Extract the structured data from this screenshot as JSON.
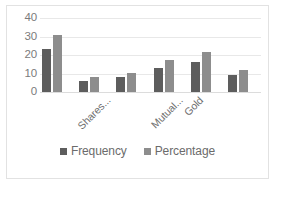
{
  "chart_data": {
    "type": "bar",
    "title": "",
    "xlabel": "",
    "ylabel": "",
    "ylim": [
      0,
      40
    ],
    "yticks": [
      "40",
      "30",
      "20",
      "10",
      "0"
    ],
    "grid": true,
    "legend_position": "bottom",
    "categories": [
      "Shares...",
      "",
      "Mutual...",
      "Gold",
      "",
      ""
    ],
    "visible_tick_labels": [
      "Shares...",
      "Mutual...",
      "Gold"
    ],
    "series": [
      {
        "name": "Frequency",
        "color": "#5d5d5d",
        "values": [
          23,
          6,
          8,
          13,
          16,
          9
        ]
      },
      {
        "name": "Percentage",
        "color": "#8d8d8d",
        "values": [
          31,
          8,
          10.5,
          17.5,
          21.5,
          12
        ]
      }
    ]
  },
  "legend": {
    "items": [
      {
        "label": "Frequency",
        "color": "#5d5d5d"
      },
      {
        "label": "Percentage",
        "color": "#8d8d8d"
      }
    ]
  }
}
